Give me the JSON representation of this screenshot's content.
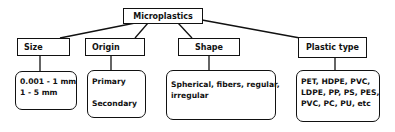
{
  "root": {
    "label": "Microplastics"
  },
  "categories": [
    {
      "label": "Size",
      "details": [
        "0.001 - 1 mm",
        "1 - 5 mm"
      ]
    },
    {
      "label": "Origin",
      "details": [
        "Primary",
        "",
        "Secondary"
      ]
    },
    {
      "label": "Shape",
      "details": [
        "Spherical, fibers, regular,",
        "irregular"
      ]
    },
    {
      "label": "Plastic type",
      "details": [
        "PET, HDPE, PVC,",
        "LDPE, PP, PS, PES,",
        "PVC, PC, PU, etc"
      ]
    }
  ],
  "colors": {
    "line": "#111111",
    "background": "#ffffff"
  }
}
